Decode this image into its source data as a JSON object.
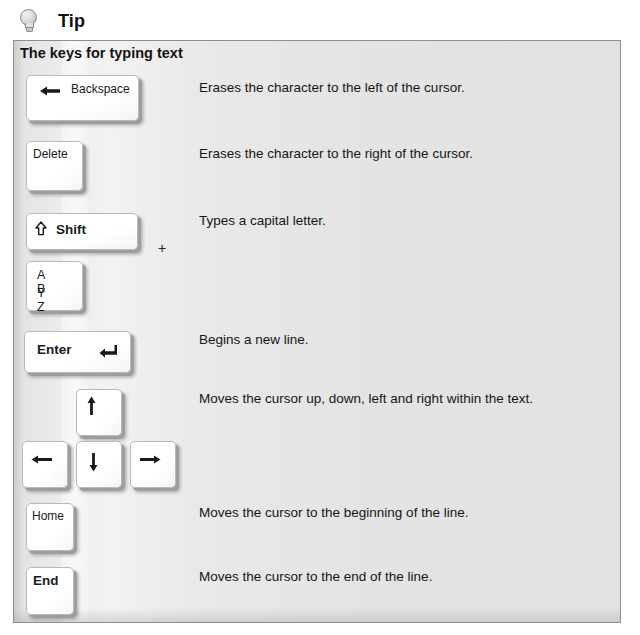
{
  "tip": {
    "icon": "lightbulb-icon",
    "title": "Tip"
  },
  "panel": {
    "heading": "The keys for typing text",
    "border_color": "#8e8e8e",
    "background_color": "#e7e7e7"
  },
  "plus_separator": "+",
  "rows": [
    {
      "id": "backspace",
      "key_label": "Backspace",
      "key_glyph": "left-arrow",
      "description": "Erases the character to the left of the cursor."
    },
    {
      "id": "delete",
      "key_label": "Delete",
      "description": "Erases the character to the right of the cursor."
    },
    {
      "id": "shift",
      "key_label": "Shift",
      "key_glyph": "shift-up-arrow",
      "description": "Types a capital letter."
    },
    {
      "id": "letters",
      "key_label_line1": "A  B",
      "key_label_line2": "Y  Z",
      "description": ""
    },
    {
      "id": "enter",
      "key_label": "Enter",
      "key_glyph": "return-arrow",
      "description": "Begins a new line."
    },
    {
      "id": "arrows",
      "key_up": "up-arrow",
      "key_left": "left-arrow",
      "key_down": "down-arrow",
      "key_right": "right-arrow",
      "description": "Moves the cursor up, down, left and right within the text."
    },
    {
      "id": "home",
      "key_label": "Home",
      "description": "Moves the cursor to the beginning of the line."
    },
    {
      "id": "end",
      "key_label": "End",
      "description": "Moves the cursor to the end of the line."
    }
  ]
}
